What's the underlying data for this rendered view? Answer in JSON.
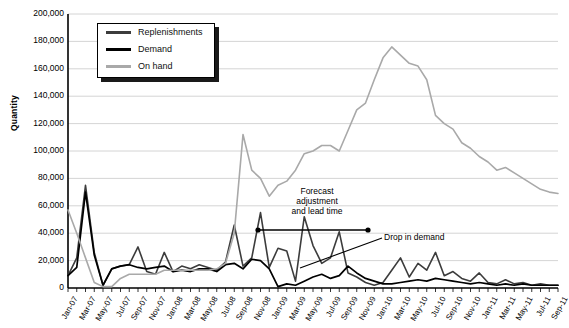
{
  "chart_data": {
    "type": "line",
    "title": "",
    "xlabel": "",
    "ylabel": "Quantity",
    "ylim": [
      0,
      200000
    ],
    "ytick_step": 20000,
    "ytick_labels": [
      "0",
      "20,000",
      "40,000",
      "60,000",
      "80,000",
      "100,000",
      "120,000",
      "140,000",
      "160,000",
      "180,000",
      "200,000"
    ],
    "grid": true,
    "legend_position": "top-left",
    "x_tick_labels": [
      "Jan-07",
      "Mar-07",
      "May-07",
      "Jul-07",
      "Sep-07",
      "Nov-07",
      "Jan-08",
      "Mar-08",
      "May-08",
      "Jul-08",
      "Sep-08",
      "Nov-08",
      "Jan-09",
      "Mar-09",
      "May-09",
      "Jul-09",
      "Sep-09",
      "Nov-09",
      "Jan-10",
      "Mar-10",
      "May-10",
      "Jul-10",
      "Sep-10",
      "Nov-10",
      "Jan-11",
      "Mar-11",
      "May-11",
      "Jul-11",
      "Sep-11"
    ],
    "x_all_months": [
      "Jan-07",
      "Feb-07",
      "Mar-07",
      "Apr-07",
      "May-07",
      "Jun-07",
      "Jul-07",
      "Aug-07",
      "Sep-07",
      "Oct-07",
      "Nov-07",
      "Dec-07",
      "Jan-08",
      "Feb-08",
      "Mar-08",
      "Apr-08",
      "May-08",
      "Jun-08",
      "Jul-08",
      "Aug-08",
      "Sep-08",
      "Oct-08",
      "Nov-08",
      "Dec-08",
      "Jan-09",
      "Feb-09",
      "Mar-09",
      "Apr-09",
      "May-09",
      "Jun-09",
      "Jul-09",
      "Aug-09",
      "Sep-09",
      "Oct-09",
      "Nov-09",
      "Dec-09",
      "Jan-10",
      "Feb-10",
      "Mar-10",
      "Apr-10",
      "May-10",
      "Jun-10",
      "Jul-10",
      "Aug-10",
      "Sep-10",
      "Oct-10",
      "Nov-10",
      "Dec-10",
      "Jan-11",
      "Feb-11",
      "Mar-11",
      "Apr-11",
      "May-11",
      "Jun-11",
      "Jul-11",
      "Aug-11",
      "Sep-11"
    ],
    "series": [
      {
        "name": "Replenishments",
        "color": "#3c3c3c",
        "values": [
          9000,
          22000,
          75000,
          26000,
          2000,
          14000,
          16000,
          17000,
          30000,
          12000,
          10000,
          26000,
          12000,
          16000,
          14000,
          17000,
          15000,
          13000,
          19000,
          46000,
          16000,
          22000,
          55000,
          15000,
          29000,
          27000,
          5000,
          52000,
          31000,
          18000,
          22000,
          41000,
          11000,
          8000,
          4000,
          2000,
          4000,
          13000,
          22000,
          8000,
          18000,
          13000,
          26000,
          9000,
          12000,
          7000,
          5000,
          11000,
          4000,
          3000,
          6000,
          3000,
          4000,
          2000,
          3000,
          2000,
          2000
        ]
      },
      {
        "name": "Demand",
        "color": "#000000",
        "values": [
          9000,
          15000,
          70000,
          24000,
          2000,
          14000,
          16000,
          17000,
          15000,
          14000,
          15000,
          16000,
          12000,
          13000,
          12000,
          14000,
          14000,
          12000,
          17000,
          18000,
          14000,
          21000,
          20000,
          14000,
          1000,
          3000,
          2000,
          5000,
          8000,
          10000,
          7000,
          9000,
          16000,
          11000,
          7000,
          5000,
          3000,
          3000,
          4000,
          5000,
          6000,
          5000,
          7000,
          6000,
          5000,
          4000,
          3000,
          4000,
          3000,
          2000,
          3000,
          2000,
          3000,
          2000,
          2000,
          2000,
          2000
        ]
      },
      {
        "name": "On hand",
        "color": "#a9a9a9",
        "values": [
          57000,
          40000,
          22000,
          4000,
          1000,
          1000,
          7000,
          10000,
          10000,
          10000,
          10000,
          13000,
          13000,
          13000,
          13000,
          13000,
          13000,
          14000,
          18000,
          40000,
          112000,
          86000,
          80000,
          67000,
          75000,
          78000,
          86000,
          98000,
          100000,
          104000,
          104000,
          100000,
          115000,
          130000,
          135000,
          152000,
          168000,
          176000,
          170000,
          164000,
          162000,
          152000,
          126000,
          120000,
          116000,
          106000,
          102000,
          96000,
          92000,
          86000,
          88000,
          84000,
          80000,
          76000,
          72000,
          70000,
          69000
        ]
      }
    ],
    "annotations": [
      {
        "name": "forecast-adjustment",
        "text": "Forecast\nadjustment\nand lead time",
        "line1": "Forecast",
        "line2": "adjustment",
        "line3": "and lead time",
        "span_start_x": 258,
        "span_end_x": 368,
        "span_y": 230
      },
      {
        "name": "drop-in-demand",
        "text": "Drop in demand",
        "leader_from_x": 382,
        "leader_from_y": 238,
        "leader_to_x": 300,
        "leader_to_y": 268
      }
    ]
  },
  "legend": {
    "items": [
      {
        "label": "Replenishments",
        "color": "#3c3c3c"
      },
      {
        "label": "Demand",
        "color": "#000000"
      },
      {
        "label": "On hand",
        "color": "#a9a9a9"
      }
    ]
  }
}
